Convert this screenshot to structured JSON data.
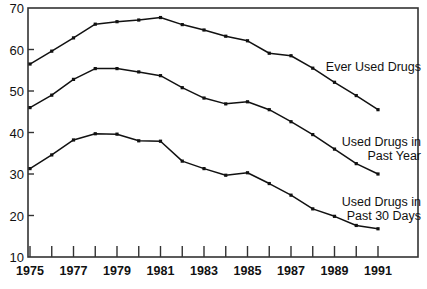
{
  "chart_data": {
    "type": "line",
    "title": "",
    "xlabel": "",
    "ylabel": "",
    "xlim": [
      1975,
      1991
    ],
    "ylim": [
      10,
      70
    ],
    "grid": false,
    "legend_position": "inline-right",
    "x": [
      1975,
      1976,
      1977,
      1978,
      1979,
      1980,
      1981,
      1982,
      1983,
      1984,
      1985,
      1986,
      1987,
      1988,
      1989,
      1990,
      1991
    ],
    "xticks": [
      1975,
      1976,
      1977,
      1978,
      1979,
      1980,
      1981,
      1982,
      1983,
      1984,
      1985,
      1986,
      1987,
      1988,
      1989,
      1990,
      1991
    ],
    "xtick_labels": [
      "1975",
      "",
      "1977",
      "",
      "1979",
      "",
      "1981",
      "",
      "1983",
      "",
      "1985",
      "",
      "1987",
      "",
      "1989",
      "",
      "1991"
    ],
    "yticks": [
      10,
      20,
      30,
      40,
      50,
      60,
      70
    ],
    "ytick_labels": [
      "10",
      "20",
      "30",
      "40",
      "50",
      "60",
      "70"
    ],
    "series": [
      {
        "name": "Ever Used Drugs",
        "label_lines": [
          "Ever Used Drugs"
        ],
        "color": "#111111",
        "marker": "square",
        "values": [
          56.5,
          59.6,
          62.8,
          66.1,
          66.7,
          67.1,
          67.7,
          66.0,
          64.7,
          63.2,
          62.1,
          59.1,
          58.5,
          55.5,
          52.1,
          48.9,
          45.5
        ]
      },
      {
        "name": "Used Drugs in Past Year",
        "label_lines": [
          "Used Drugs in",
          "Past Year"
        ],
        "color": "#111111",
        "marker": "square",
        "values": [
          46.0,
          49.0,
          52.8,
          55.4,
          55.4,
          54.6,
          53.7,
          50.8,
          48.3,
          46.9,
          47.4,
          45.5,
          42.6,
          39.5,
          36.0,
          32.5,
          30.0
        ]
      },
      {
        "name": "Used Drugs in Past 30 Days",
        "label_lines": [
          "Used Drugs in",
          "Past 30 Days"
        ],
        "color": "#111111",
        "marker": "square",
        "values": [
          31.3,
          34.6,
          38.2,
          39.7,
          39.6,
          38.0,
          37.9,
          33.1,
          31.3,
          29.7,
          30.3,
          27.7,
          24.9,
          21.6,
          19.8,
          17.6,
          16.8
        ]
      }
    ]
  },
  "figure": {
    "frame_color": "#333333",
    "background": "#ffffff",
    "caption": ""
  }
}
